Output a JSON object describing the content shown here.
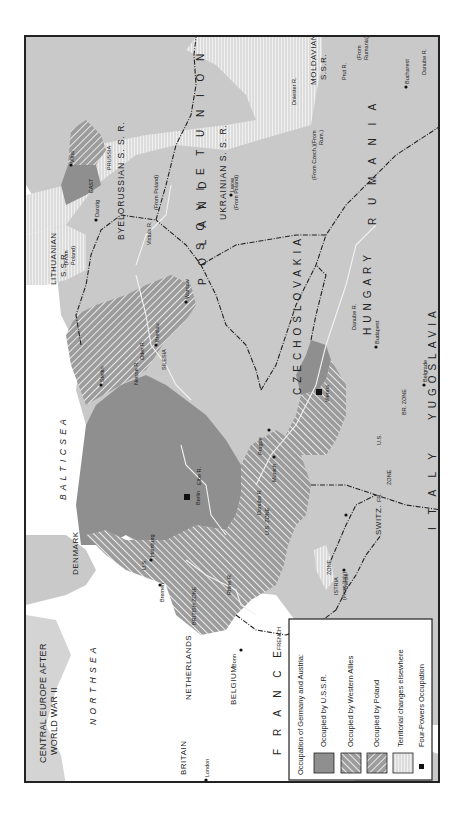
{
  "title": {
    "line1": "CENTRAL EUROPE AFTER",
    "line2": "WORLD WAR II"
  },
  "colors": {
    "land": "#c9c9c9",
    "sea": "#ffffff",
    "ussr_occupied": "#8f8f8f",
    "western_allies": "#9a9a9a",
    "poland_occupied": "#a5a5a5",
    "territorial": "#e6e6e6",
    "border": "#222222",
    "river": "#f2f2f2"
  },
  "legend": {
    "heading": "Occupation of Germany and Austria:",
    "items": [
      {
        "label": "Occupied by U.S.S.R.",
        "swatch": "solid-dark"
      },
      {
        "label": "Occupied by Western Allies",
        "swatch": "hatch-right"
      },
      {
        "label": "Occupied by Poland",
        "swatch": "hatch-left"
      },
      {
        "label": "Territorial changes elsewhere",
        "swatch": "vertical-lines"
      },
      {
        "label": "Four-Powers Occupation",
        "swatch": "black-square"
      }
    ]
  },
  "seas": {
    "north_sea": "N O R T H   S E A",
    "baltic_sea": "B A L T I C   S E A"
  },
  "countries": {
    "britain": "BRITAIN",
    "france": "F R A N C E",
    "belgium": "BELGIUM",
    "netherlands": "NETHERLANDS",
    "lux": "LUX.",
    "denmark": "DENMARK",
    "switz": "SWITZ.",
    "italy": "I T A L Y",
    "czechoslovakia": "CZECHOSLOVAKIA",
    "poland": "P O L A N D",
    "hungary": "HUNGARY",
    "yugoslavia": "YUGOSLAVIA",
    "rumania": "R U M A N I A",
    "soviet_union": "S O V I E T   U N I O N",
    "byelorussian": "BYELORUSSIAN S. S. R.",
    "ukrainian": "UKRAINIAN S. S. R.",
    "lithuanian_1": "LITHUANIAN",
    "lithuanian_2": "S.S.R.",
    "moldavian_1": "MOLDAVIAN",
    "moldavian_2": "S.S.R.",
    "east": "EAST",
    "prussia": "PRUSSIA",
    "silesia": "SILESIA",
    "istria": "ISTRIA"
  },
  "zones": {
    "british": "BRITISH ZONE",
    "us": "U.S. ZONE",
    "french": "FRENCH",
    "fr_zone": "ZONE",
    "us_small": "U.S.",
    "br_zone": "BR. ZONE",
    "us_austria": "U.S.",
    "fr_austria_1": "FR.",
    "fr_austria_2": "ZONE"
  },
  "annotations": {
    "from_poland_1": "(From Poland)",
    "from_poland_2": "(From Poland)",
    "from_poland_vilna_1": "(From",
    "from_poland_vilna_2": "Poland)",
    "from_rumania_1": "(From",
    "from_rumania_2": "Rumania)",
    "from_rum_1": "(From",
    "from_rum_2": "Rum.)",
    "from_czech": "(From Czech.)",
    "from_italy": "(From Italy)"
  },
  "cities": {
    "london": "London",
    "paris": "Paris",
    "bonn": "Bonn",
    "bremen": "Bremen",
    "hamburg": "Hamburg",
    "berlin": "Berlin",
    "munich": "Munich",
    "vienna": "Vienna",
    "prague": "Prague",
    "stettin": "Stettin",
    "breslau": "Breslau",
    "danzig": "Danzig",
    "warsaw": "Warsaw",
    "budapest": "Budapest",
    "belgrade": "Belgrade",
    "trieste": "Trieste",
    "vilna": "Vilna",
    "lwow": "Lwow",
    "bucharest": "Bucharest"
  },
  "rivers": {
    "rhine": "Rhine R.",
    "elbe": "Elbe R.",
    "oder": "Oder R.",
    "neisse": "Neisse R.",
    "vistula": "Vistula R.",
    "danube_1": "Danube R.",
    "danube_2": "Danube R.",
    "danube_3": "Danube R.",
    "dniester": "Dniester R.",
    "prut": "Prut R."
  }
}
